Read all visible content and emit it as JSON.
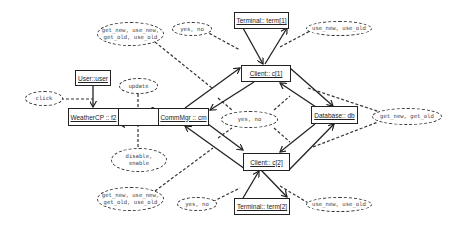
{
  "diagram": {
    "type": "uml-communication-diagram",
    "objects": {
      "terminal1": "Terminal:: term[1]",
      "client1": "Client:: c[1]",
      "database": "Database:: db",
      "client2": "Client:: c[2]",
      "terminal2": "Terminal:: term[2]",
      "user": "User::user",
      "weather": "WeatherCP :: f2",
      "middle": "",
      "commmgr": "CommMgr :: cm"
    },
    "messages": {
      "top_left": "get_new, use_new,\nget_old, use_old",
      "top_yes_no": "yes, no",
      "top_right": "use_new, use_old",
      "center_yes_no": "yes, no",
      "db_right": "get_new, get_old",
      "click": "click",
      "update": "update",
      "disable": "disable,\nenable",
      "bottom_left": "get_new, use_new,\nget_old, use_old",
      "bottom_yes_no": "yes, no",
      "bottom_right": "use_new, use_old"
    }
  }
}
